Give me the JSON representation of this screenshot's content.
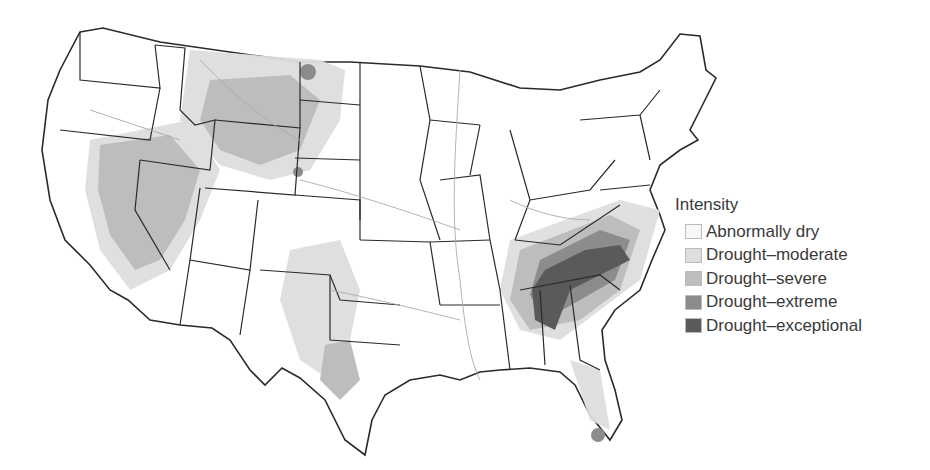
{
  "map": {
    "region": "Contiguous United States",
    "type": "choropleth / drought intensity"
  },
  "legend": {
    "title": "Intensity",
    "items": [
      {
        "label": "Abnormally dry",
        "color": "#f7f7f7"
      },
      {
        "label": "Drought–moderate",
        "color": "#dedede"
      },
      {
        "label": "Drought–severe",
        "color": "#bdbdbd"
      },
      {
        "label": "Drought–extreme",
        "color": "#8c8c8c"
      },
      {
        "label": "Drought–exceptional",
        "color": "#5a5a5a"
      }
    ]
  },
  "colors": {
    "state_border": "#2a2a2a",
    "river": "#aaaaaa",
    "background": "#ffffff"
  }
}
